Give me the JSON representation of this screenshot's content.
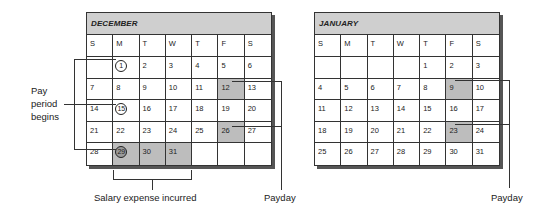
{
  "calendars": [
    {
      "month": "DECEMBER",
      "weekdays": [
        "S",
        "M",
        "T",
        "W",
        "T",
        "F",
        "S"
      ],
      "weeks": [
        [
          "",
          "1",
          "2",
          "3",
          "4",
          "5",
          "6"
        ],
        [
          "7",
          "8",
          "9",
          "10",
          "11",
          "12",
          "13"
        ],
        [
          "14",
          "15",
          "16",
          "17",
          "18",
          "19",
          "20"
        ],
        [
          "21",
          "22",
          "23",
          "24",
          "25",
          "26",
          "27"
        ],
        [
          "28",
          "29",
          "30",
          "31",
          "",
          "",
          ""
        ]
      ],
      "shaded": [
        "12",
        "26",
        "29",
        "30",
        "31"
      ],
      "circled": [
        "1",
        "15",
        "29"
      ]
    },
    {
      "month": "JANUARY",
      "weekdays": [
        "S",
        "M",
        "T",
        "W",
        "T",
        "F",
        "S"
      ],
      "weeks": [
        [
          "",
          "",
          "",
          "",
          "1",
          "2",
          "3"
        ],
        [
          "4",
          "5",
          "6",
          "7",
          "8",
          "9",
          "10"
        ],
        [
          "11",
          "12",
          "13",
          "14",
          "15",
          "16",
          "17"
        ],
        [
          "18",
          "19",
          "20",
          "21",
          "22",
          "23",
          "24"
        ],
        [
          "25",
          "26",
          "27",
          "28",
          "29",
          "30",
          "31"
        ]
      ],
      "shaded": [
        "9",
        "23"
      ],
      "circled": []
    }
  ],
  "annotations": {
    "pay_period_line1": "Pay",
    "pay_period_line2": "period",
    "pay_period_line3": "begins",
    "salary_expense": "Salary expense incurred",
    "payday_dec": "Payday",
    "payday_jan": "Payday"
  },
  "colors": {
    "header_fill": "#cfcfcf",
    "shaded_fill": "#bdbdbd",
    "line": "#333333"
  }
}
